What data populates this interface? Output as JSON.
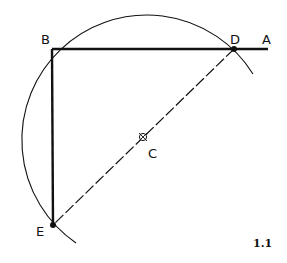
{
  "figure": {
    "number": "1.1",
    "labels": {
      "A": "A",
      "B": "B",
      "C": "C",
      "D": "D",
      "E": "E"
    },
    "points": {
      "A": [
        268,
        49
      ],
      "B": [
        52,
        49
      ],
      "C": [
        143,
        137
      ],
      "D": [
        234,
        49
      ],
      "E": [
        53,
        225
      ]
    },
    "circle": {
      "center": "C",
      "radius": 125
    },
    "colors": {
      "ink": "#111111",
      "background": "#ffffff"
    }
  }
}
